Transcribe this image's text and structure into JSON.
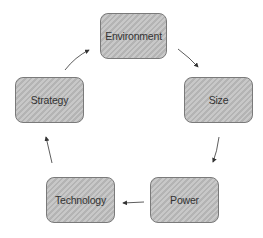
{
  "diagram": {
    "type": "cycle",
    "nodes": [
      {
        "id": "environment",
        "label": "Environment"
      },
      {
        "id": "size",
        "label": "Size"
      },
      {
        "id": "power",
        "label": "Power"
      },
      {
        "id": "technology",
        "label": "Technology"
      },
      {
        "id": "strategy",
        "label": "Strategy"
      }
    ],
    "edges": [
      {
        "from": "environment",
        "to": "size"
      },
      {
        "from": "size",
        "to": "power"
      },
      {
        "from": "power",
        "to": "technology"
      },
      {
        "from": "technology",
        "to": "strategy"
      },
      {
        "from": "strategy",
        "to": "environment"
      }
    ],
    "colors": {
      "node_fill": "#c0c0c0",
      "node_border": "#7a7a7a",
      "arrow": "#333333",
      "text": "#333333"
    }
  }
}
